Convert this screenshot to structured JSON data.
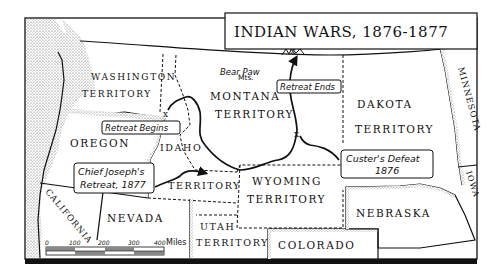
{
  "title": "INDIAN WARS, 1876-1877",
  "regions": {
    "washington": [
      "WASHINGTON",
      "TERRITORY"
    ],
    "oregon": "OREGON",
    "idaho": [
      "IDAHO",
      "TERRITORY"
    ],
    "montana": [
      "MONTANA",
      "TERRITORY"
    ],
    "dakota": [
      "DAKOTA",
      "TERRITORY"
    ],
    "minnesota": "MINNESOTA",
    "wyoming": [
      "WYOMING",
      "TERRITORY"
    ],
    "california": "CALIFORNIA",
    "nevada": "NEVADA",
    "utah": [
      "UTAH",
      "TERRITORY"
    ],
    "colorado": "COLORADO",
    "nebraska": "NEBRASKA",
    "iowa": "IOWA"
  },
  "landmarks": {
    "bear_paw": [
      "Bear Paw",
      "Mts."
    ]
  },
  "callouts": {
    "retreat_begins": "Retreat Begins",
    "retreat_ends": "Retreat Ends",
    "chief_joseph": [
      "Chief Joseph's",
      "Retreat, 1877"
    ],
    "custers_defeat": [
      "Custer's Defeat",
      "1876"
    ]
  },
  "scale": {
    "ticks": [
      "0",
      "100",
      "200",
      "300",
      "400"
    ],
    "unit": "Miles"
  },
  "colors": {
    "ink": "#111111",
    "paper": "#ffffff",
    "stipple": "#8a8a8a"
  }
}
